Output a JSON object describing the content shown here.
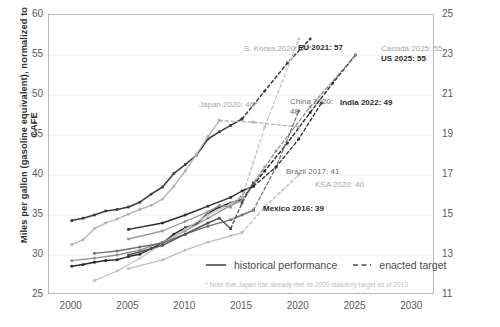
{
  "chart_data": {
    "type": "line",
    "title": "",
    "ylabel": "Miles per gallon (gasoline equivalent), normalized to CAFE",
    "ylabel_right": "Kilometers per liter (gasoline equivalent)",
    "xlabel": "",
    "xlim": [
      1998,
      2032
    ],
    "ylim": [
      25,
      60
    ],
    "ylim_right": [
      11,
      25
    ],
    "grid": true,
    "legend_position": "bottom-center",
    "xticks": [
      "2000",
      "2005",
      "2010",
      "2015",
      "2020",
      "2025",
      "2030"
    ],
    "xtick_values": [
      2000,
      2005,
      2010,
      2015,
      2020,
      2025,
      2030
    ],
    "yticks_left": [
      "60",
      "55",
      "50",
      "45",
      "40",
      "35",
      "30",
      "25"
    ],
    "ytick_values_left": [
      60,
      55,
      50,
      45,
      40,
      35,
      30,
      25
    ],
    "yticks_right": [
      "25",
      "23",
      "21",
      "19",
      "17",
      "15",
      "13",
      "11"
    ],
    "ytick_values_right": [
      25,
      23,
      21,
      19,
      17,
      15,
      13,
      11
    ],
    "legend": [
      {
        "label": "historical performance",
        "style": "solid"
      },
      {
        "label": "enacted target",
        "style": "dashed"
      }
    ],
    "footnote": "* Note that Japan has already met its 2020 statutory target as of 2013",
    "annotations": [
      {
        "id": "s-korea",
        "text": "S. Korea 2020: 57*",
        "emphasis": "gray",
        "x": 244,
        "y": 44
      },
      {
        "id": "eu",
        "text": "EU 2021: 57",
        "emphasis": "dark",
        "x": 298,
        "y": 43
      },
      {
        "id": "canada",
        "text": "Canada 2025: 55",
        "emphasis": "gray",
        "x": 381,
        "y": 44
      },
      {
        "id": "us",
        "text": "US 2025: 55",
        "emphasis": "dark",
        "x": 381,
        "y": 54
      },
      {
        "id": "japan",
        "text": "Japan 2020: 46*",
        "emphasis": "gray",
        "x": 199,
        "y": 100
      },
      {
        "id": "china",
        "text": "China 2020:\n48",
        "emphasis": "mid",
        "x": 290,
        "y": 97
      },
      {
        "id": "india",
        "text": "India 2022: 49",
        "emphasis": "dark",
        "x": 340,
        "y": 98
      },
      {
        "id": "brazil",
        "text": "Brazil 2017: 41",
        "emphasis": "mid",
        "x": 286,
        "y": 167
      },
      {
        "id": "ksa",
        "text": "KSA 2020: 40",
        "emphasis": "gray",
        "x": 315,
        "y": 180
      },
      {
        "id": "mexico",
        "text": "Mexico 2016: 39",
        "emphasis": "dark",
        "x": 263,
        "y": 204
      }
    ],
    "series": [
      {
        "name": "US",
        "style": "solid",
        "color": "#2b2b2b",
        "width": 1.5,
        "markers": true,
        "x": [
          2000,
          2001,
          2002,
          2003,
          2004,
          2005,
          2006,
          2007,
          2008,
          2009,
          2010,
          2011,
          2012,
          2013,
          2014,
          2015
        ],
        "y": [
          28.6,
          28.8,
          29.1,
          29.3,
          29.4,
          29.8,
          30.1,
          30.8,
          31.5,
          32.6,
          33.4,
          33.9,
          35.2,
          36.0,
          36.5,
          37.0
        ]
      },
      {
        "name": "US target",
        "style": "dashed",
        "color": "#2b2b2b",
        "width": 1.4,
        "markers": true,
        "x": [
          2015,
          2017,
          2019,
          2021,
          2023,
          2025
        ],
        "y": [
          37.0,
          40.5,
          44.0,
          47.8,
          51.5,
          55.0
        ]
      },
      {
        "name": "Canada",
        "style": "solid",
        "color": "#8f8f8f",
        "width": 1.3,
        "markers": true,
        "x": [
          2000,
          2002,
          2004,
          2006,
          2008,
          2010,
          2012,
          2014,
          2015
        ],
        "y": [
          29.3,
          29.6,
          30.0,
          30.6,
          31.6,
          33.0,
          34.6,
          36.2,
          36.8
        ]
      },
      {
        "name": "Canada target",
        "style": "dashed",
        "color": "#8f8f8f",
        "width": 1.3,
        "markers": true,
        "x": [
          2015,
          2018,
          2021,
          2025
        ],
        "y": [
          36.8,
          43.0,
          48.5,
          55.0
        ]
      },
      {
        "name": "EU",
        "style": "solid",
        "color": "#3a3a3a",
        "width": 1.5,
        "markers": true,
        "x": [
          2000,
          2001,
          2002,
          2003,
          2004,
          2005,
          2006,
          2007,
          2008,
          2009,
          2010,
          2011,
          2012,
          2013,
          2014,
          2015
        ],
        "y": [
          34.3,
          34.6,
          35.0,
          35.5,
          35.7,
          36.0,
          36.6,
          37.6,
          38.5,
          40.2,
          41.3,
          42.5,
          44.5,
          45.4,
          46.2,
          47.0
        ]
      },
      {
        "name": "EU target",
        "style": "dashed",
        "color": "#3a3a3a",
        "width": 1.4,
        "markers": true,
        "x": [
          2015,
          2017,
          2019,
          2021
        ],
        "y": [
          47.0,
          50.5,
          54.0,
          57.0
        ]
      },
      {
        "name": "Japan",
        "style": "solid",
        "color": "#b0b0b0",
        "width": 1.3,
        "markers": true,
        "x": [
          2000,
          2001,
          2002,
          2003,
          2004,
          2005,
          2006,
          2007,
          2008,
          2009,
          2010,
          2011,
          2012,
          2013
        ],
        "y": [
          31.3,
          31.9,
          33.3,
          34.0,
          34.5,
          35.1,
          35.7,
          36.2,
          37.0,
          38.6,
          40.5,
          42.6,
          44.8,
          46.8
        ]
      },
      {
        "name": "Japan target",
        "style": "dashed",
        "color": "#b0b0b0",
        "width": 1.3,
        "markers": true,
        "x": [
          2013,
          2016,
          2020
        ],
        "y": [
          46.8,
          46.6,
          46.0
        ]
      },
      {
        "name": "S. Korea",
        "style": "solid",
        "color": "#c2c2c2",
        "width": 1.3,
        "markers": true,
        "x": [
          2002,
          2004,
          2006,
          2008,
          2010,
          2012,
          2014,
          2015
        ],
        "y": [
          26.8,
          28.0,
          29.6,
          31.4,
          33.2,
          35.0,
          36.4,
          37.2
        ]
      },
      {
        "name": "S. Korea target",
        "style": "dashed",
        "color": "#c2c2c2",
        "width": 1.3,
        "markers": true,
        "x": [
          2015,
          2017,
          2020
        ],
        "y": [
          37.2,
          46.0,
          57.0
        ]
      },
      {
        "name": "China",
        "style": "solid",
        "color": "#707070",
        "width": 1.4,
        "markers": true,
        "x": [
          2002,
          2004,
          2006,
          2008,
          2010,
          2012,
          2014,
          2015,
          2016
        ],
        "y": [
          30.2,
          30.5,
          31.0,
          31.5,
          32.6,
          33.6,
          34.4,
          35.0,
          35.6
        ]
      },
      {
        "name": "China target",
        "style": "dashed",
        "color": "#707070",
        "width": 1.3,
        "markers": true,
        "x": [
          2016,
          2018,
          2020
        ],
        "y": [
          35.6,
          41.0,
          48.0
        ]
      },
      {
        "name": "India",
        "style": "solid",
        "color": "#2b2b2b",
        "width": 1.4,
        "markers": true,
        "x": [
          2005,
          2008,
          2010,
          2012,
          2014,
          2015,
          2016
        ],
        "y": [
          33.2,
          34.0,
          35.0,
          36.1,
          37.2,
          38.0,
          38.6
        ]
      },
      {
        "name": "India target",
        "style": "dashed",
        "color": "#2b2b2b",
        "width": 1.3,
        "markers": true,
        "x": [
          2016,
          2018,
          2020,
          2022
        ],
        "y": [
          38.6,
          41.0,
          44.5,
          49.0
        ]
      },
      {
        "name": "Brazil",
        "style": "solid",
        "color": "#9b9b9b",
        "width": 1.3,
        "markers": true,
        "x": [
          2005,
          2008,
          2010,
          2012,
          2013,
          2014
        ],
        "y": [
          32.0,
          33.0,
          34.2,
          35.4,
          36.2,
          36.0
        ]
      },
      {
        "name": "Brazil target",
        "style": "dashed",
        "color": "#9b9b9b",
        "width": 1.3,
        "markers": true,
        "x": [
          2014,
          2016,
          2017
        ],
        "y": [
          36.0,
          39.0,
          41.0
        ]
      },
      {
        "name": "Mexico",
        "style": "solid",
        "color": "#4f4f4f",
        "width": 1.4,
        "markers": true,
        "x": [
          2005,
          2008,
          2010,
          2012,
          2013,
          2014
        ],
        "y": [
          30.0,
          31.2,
          32.6,
          34.0,
          34.6,
          33.3
        ]
      },
      {
        "name": "Mexico target",
        "style": "dashed",
        "color": "#4f4f4f",
        "width": 1.3,
        "markers": true,
        "x": [
          2014,
          2015,
          2016
        ],
        "y": [
          33.3,
          36.5,
          39.0
        ]
      },
      {
        "name": "KSA",
        "style": "solid",
        "color": "#bdbdbd",
        "width": 1.3,
        "markers": true,
        "x": [
          2005,
          2008,
          2010,
          2012,
          2014,
          2015
        ],
        "y": [
          28.3,
          29.4,
          30.6,
          31.6,
          32.4,
          32.8
        ]
      },
      {
        "name": "KSA target",
        "style": "dashed",
        "color": "#bdbdbd",
        "width": 1.3,
        "markers": true,
        "x": [
          2015,
          2017,
          2020
        ],
        "y": [
          32.8,
          36.0,
          40.0
        ]
      }
    ]
  }
}
